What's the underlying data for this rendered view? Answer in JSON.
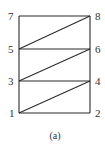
{
  "figure": {
    "caption": "(a)",
    "nodes": [
      {
        "id": "1",
        "label": "1",
        "x": 19,
        "y": 113,
        "lx": 9,
        "ly": 117
      },
      {
        "id": "2",
        "label": "2",
        "x": 90,
        "y": 113,
        "lx": 95,
        "ly": 117
      },
      {
        "id": "3",
        "label": "3",
        "x": 19,
        "y": 81,
        "lx": 8,
        "ly": 85
      },
      {
        "id": "4",
        "label": "4",
        "x": 90,
        "y": 81,
        "lx": 95,
        "ly": 85
      },
      {
        "id": "5",
        "label": "5",
        "x": 19,
        "y": 49,
        "lx": 8,
        "ly": 53
      },
      {
        "id": "6",
        "label": "6",
        "x": 90,
        "y": 49,
        "lx": 95,
        "ly": 53
      },
      {
        "id": "7",
        "label": "7",
        "x": 19,
        "y": 16,
        "lx": 8,
        "ly": 20
      },
      {
        "id": "8",
        "label": "8",
        "x": 90,
        "y": 16,
        "lx": 95,
        "ly": 20
      }
    ],
    "edges": [
      [
        "1",
        "2"
      ],
      [
        "3",
        "4"
      ],
      [
        "5",
        "6"
      ],
      [
        "7",
        "8"
      ],
      [
        "1",
        "3"
      ],
      [
        "3",
        "5"
      ],
      [
        "5",
        "7"
      ],
      [
        "2",
        "4"
      ],
      [
        "4",
        "6"
      ],
      [
        "6",
        "8"
      ],
      [
        "1",
        "4"
      ],
      [
        "3",
        "6"
      ],
      [
        "5",
        "8"
      ]
    ],
    "colors": {
      "stroke": "#2a2a2a",
      "text": "#333333",
      "background": "#ffffff"
    }
  }
}
